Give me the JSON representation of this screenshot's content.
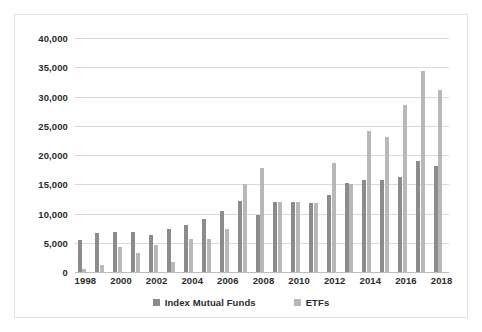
{
  "chart_data": {
    "type": "bar",
    "title": "",
    "subtitle": "",
    "xlabel": "",
    "ylabel": "",
    "grid": true,
    "legend_position": "bottom",
    "ylim": [
      0,
      40000
    ],
    "ytick_labels": [
      "40,000",
      "35,000",
      "30,000",
      "25,000",
      "20,000",
      "15,000",
      "10,000",
      "5,000",
      "0"
    ],
    "ytick_values": [
      40000,
      35000,
      30000,
      25000,
      20000,
      15000,
      10000,
      5000,
      0
    ],
    "categories": [
      "1998",
      "1999",
      "2000",
      "2001",
      "2002",
      "2003",
      "2004",
      "2005",
      "2006",
      "2007",
      "2008",
      "2009",
      "2010",
      "2011",
      "2012",
      "2013",
      "2014",
      "2015",
      "2016",
      "2017",
      "2018"
    ],
    "xtick_labels": [
      "1998",
      "2000",
      "2002",
      "2004",
      "2006",
      "2008",
      "2010",
      "2012",
      "2014",
      "2016",
      "2018"
    ],
    "series": [
      {
        "name": "Index Mutual Funds",
        "color": "#8c8c8c",
        "values": [
          5400,
          6600,
          6900,
          6900,
          6300,
          7400,
          8100,
          9000,
          10400,
          12100,
          9700,
          11900,
          12000,
          11800,
          13200,
          15300,
          15700,
          15800,
          16300,
          18900,
          18200
        ]
      },
      {
        "name": "ETFs",
        "color": "#b8b8b8",
        "values": [
          600,
          1200,
          4300,
          3200,
          4600,
          1700,
          5700,
          5700,
          7400,
          15000,
          17700,
          11900,
          12000,
          11800,
          18600,
          15100,
          24100,
          23100,
          28500,
          34300,
          31100
        ]
      }
    ]
  },
  "legend": {
    "items": [
      {
        "label": "Index Mutual Funds",
        "color": "#8c8c8c"
      },
      {
        "label": "ETFs",
        "color": "#b8b8b8"
      }
    ]
  }
}
